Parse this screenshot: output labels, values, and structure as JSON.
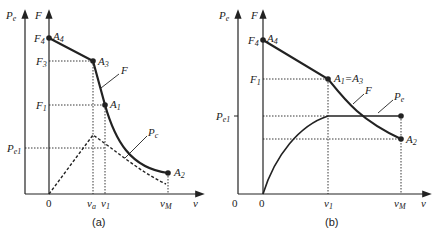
{
  "panels": [
    {
      "id": "a",
      "caption": "(a)",
      "axes": {
        "y_left": "P",
        "y_left_sub": "e",
        "y_right": "F",
        "x": "v",
        "origin": "0"
      },
      "y_ticks": {
        "F4": "F",
        "F4_sub": "4",
        "F3": "F",
        "F3_sub": "3",
        "F1": "F",
        "F1_sub": "1",
        "Pe1": "P",
        "Pe1_sub": "e1"
      },
      "x_ticks": {
        "va": "v",
        "va_sub": "a",
        "v1": "v",
        "v1_sub": "1",
        "vM": "v",
        "vM_sub": "M"
      },
      "points": {
        "A4": "A",
        "A4_sub": "4",
        "A3": "A",
        "A3_sub": "3",
        "A1": "A",
        "A1_sub": "1",
        "A2": "A",
        "A2_sub": "2"
      },
      "curves": {
        "F": "F",
        "Pc": "P",
        "Pc_sub": "c"
      }
    },
    {
      "id": "b",
      "caption": "(b)",
      "axes": {
        "y_left": "P",
        "y_left_sub": "e",
        "y_right": "F",
        "x": "v",
        "origin_left": "0",
        "origin": "0"
      },
      "y_ticks": {
        "F4": "F",
        "F4_sub": "4",
        "F1": "F",
        "F1_sub": "1",
        "Pe1": "P",
        "Pe1_sub": "e1"
      },
      "x_ticks": {
        "v1": "v",
        "v1_sub": "1",
        "vM": "v",
        "vM_sub": "M"
      },
      "points": {
        "A4": "A",
        "A4_sub": "4",
        "A13": "A",
        "A13_sub": "1",
        "A13_eq": "=A",
        "A13_sub2": "3",
        "A2": "A",
        "A2_sub": "2"
      },
      "curves": {
        "F": "F",
        "Pe": "P",
        "Pe_sub": "e"
      }
    }
  ]
}
